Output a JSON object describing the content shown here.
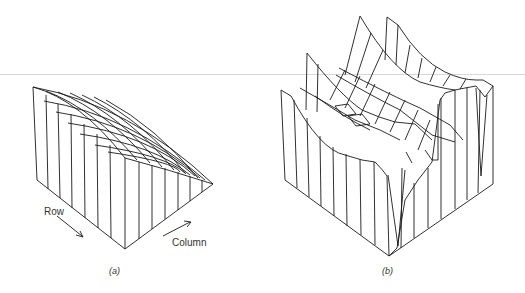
{
  "figure": {
    "panels": [
      {
        "id": "a",
        "caption": "(a)",
        "description": "Planar sloped surface mesh (3D wireframe)"
      },
      {
        "id": "b",
        "caption": "(b)",
        "description": "Ridged / valley surface mesh (3D wireframe)"
      }
    ],
    "axis_labels": {
      "row": "Row",
      "column": "Column"
    },
    "colors": {
      "line": "#1a1a1a",
      "background": "#ffffff",
      "rule": "#d8d8d8"
    }
  }
}
